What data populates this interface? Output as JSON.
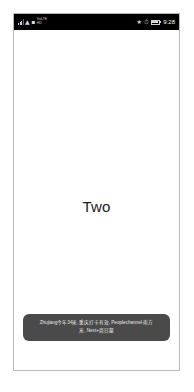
{
  "device": {
    "status_bar": {
      "left_icons": [
        "signal-icon",
        "wifi-icon",
        "sim-icon"
      ],
      "left_label_top": "VoLTE",
      "left_label_bottom": "HD",
      "right_icons": [
        "bluetooth-icon",
        "alarm-icon",
        "battery-icon"
      ],
      "time": "9:28"
    },
    "screen": {
      "page_label": "Two",
      "toast": {
        "line1": "Zhujiang今年34米,重庆打卡有效, Peoplechannel-南方",
        "line2": "米, Next+周日赢"
      }
    }
  },
  "colors": {
    "status_bar_bg": "#000000",
    "screen_bg": "#ffffff",
    "toast_bg": "#4a4a4a",
    "toast_text": "#e8e8e8",
    "frame_border": "#b9b9b9",
    "page_label_text": "#1c1c1c"
  }
}
